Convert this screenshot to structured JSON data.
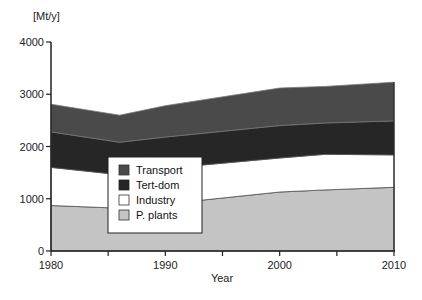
{
  "chart_data": {
    "type": "area",
    "stacked": true,
    "title": "",
    "ylabel": "[Mt/y]",
    "xlabel": "Year",
    "x": [
      1980,
      1986,
      1990,
      2000,
      2004,
      2010
    ],
    "xticks": [
      1980,
      1985,
      1990,
      1995,
      2000,
      2005,
      2010
    ],
    "xtick_labels": [
      "1980",
      "1990",
      "2000",
      "2010"
    ],
    "yticks": [
      0,
      1000,
      2000,
      3000,
      4000
    ],
    "ytick_labels": [
      "0",
      "1000",
      "2000",
      "3000",
      "4000"
    ],
    "xlim": [
      1980,
      2010
    ],
    "ylim": [
      0,
      4000
    ],
    "grid": false,
    "legend_position": "inside-lower-left",
    "series": [
      {
        "name": "P. plants",
        "values": [
          870,
          820,
          900,
          1130,
          1170,
          1220
        ],
        "color": "#c4c4c4"
      },
      {
        "name": "Industry",
        "values": [
          730,
          640,
          680,
          650,
          680,
          620
        ],
        "color": "#ffffff"
      },
      {
        "name": "Tert-dom",
        "values": [
          680,
          620,
          600,
          620,
          600,
          650
        ],
        "color": "#262626"
      },
      {
        "name": "Transport",
        "values": [
          530,
          520,
          600,
          720,
          700,
          740
        ],
        "color": "#4a4a4a"
      }
    ],
    "cumulative_tops": [
      2810,
      2600,
      2780,
      3120,
      3150,
      3230
    ]
  },
  "axes": {
    "y_unit": "[Mt/y]",
    "x_title": "Year"
  },
  "legend": {
    "items": [
      {
        "label": "Transport",
        "color": "#4a4a4a"
      },
      {
        "label": "Tert-dom",
        "color": "#262626"
      },
      {
        "label": "Industry",
        "color": "#ffffff"
      },
      {
        "label": "P. plants",
        "color": "#c4c4c4"
      }
    ]
  }
}
